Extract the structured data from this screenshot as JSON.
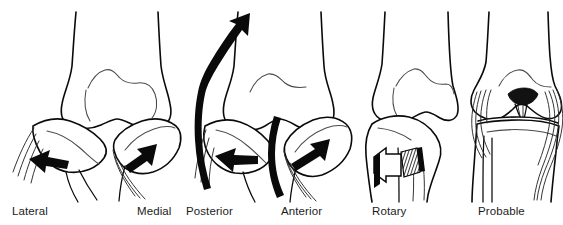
{
  "figure": {
    "kind": "medical-illustration",
    "background_color": "#ffffff",
    "line_color": "#0a0a0a",
    "inner_line_color": "#4a4a4a",
    "label_color": "#1c1c1c",
    "width": 563,
    "height": 225
  },
  "panels": [
    {
      "id": "lateral-medial",
      "labels": [
        {
          "text": "Lateral",
          "x": 12,
          "y": 215
        },
        {
          "text": "Medial",
          "x": 137,
          "y": 215
        }
      ],
      "arrows": [
        {
          "name": "lateral-arrow",
          "direction": "left",
          "style": "solid-tapered"
        },
        {
          "name": "medial-arrow",
          "direction": "up-right",
          "style": "solid-tapered"
        }
      ]
    },
    {
      "id": "posterior-anterior",
      "labels": [
        {
          "text": "Posterior",
          "x": 186,
          "y": 215
        },
        {
          "text": "Anterior",
          "x": 281,
          "y": 215
        }
      ],
      "arrows": [
        {
          "name": "posterior-sweep-arrow",
          "direction": "up",
          "style": "curved-band"
        },
        {
          "name": "posterior-arrow",
          "direction": "left",
          "style": "solid-tapered"
        },
        {
          "name": "anterior-sweep-arrow",
          "direction": "down",
          "style": "curved-band"
        },
        {
          "name": "anterior-arrow",
          "direction": "up-right",
          "style": "solid-tapered"
        }
      ]
    },
    {
      "id": "rotary",
      "labels": [
        {
          "text": "Rotary",
          "x": 372,
          "y": 215
        }
      ],
      "arrows": [
        {
          "name": "rotary-arrow",
          "direction": "rotational",
          "style": "3d-band"
        }
      ]
    },
    {
      "id": "probable",
      "labels": [
        {
          "text": "Probable",
          "x": 478,
          "y": 215
        }
      ],
      "arrows": []
    }
  ],
  "labels_flat": [
    "Lateral",
    "Medial",
    "Posterior",
    "Anterior",
    "Rotary",
    "Probable"
  ]
}
